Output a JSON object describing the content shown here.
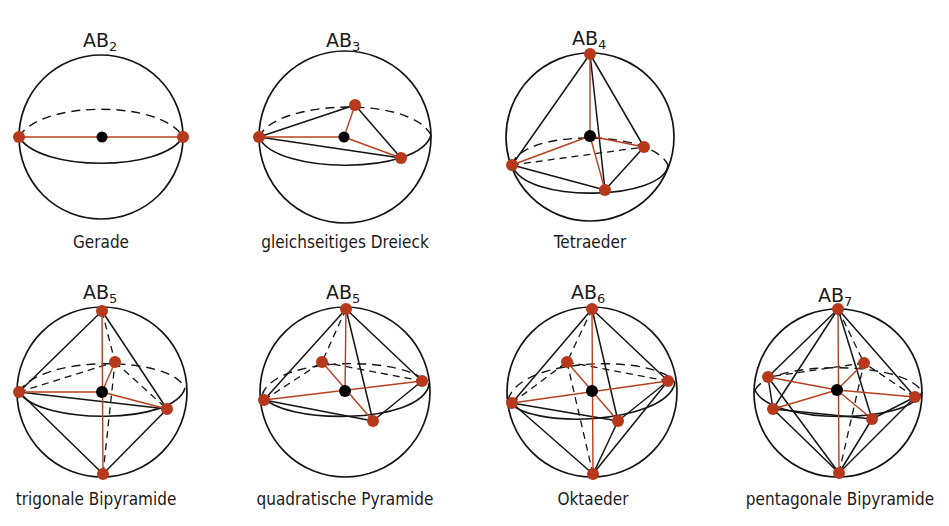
{
  "figure": {
    "colors": {
      "ligand_atom": "#b5391a",
      "bond_line": "#b8401e",
      "central_atom": "#000000",
      "outline": "#141414",
      "background": "#ffffff"
    },
    "panels": [
      {
        "formula_base": "AB",
        "formula_sub": "2",
        "caption": "Gerade"
      },
      {
        "formula_base": "AB",
        "formula_sub": "3",
        "caption": "gleichseitiges Dreieck"
      },
      {
        "formula_base": "AB",
        "formula_sub": "4",
        "caption": "Tetraeder"
      },
      {
        "formula_base": "AB",
        "formula_sub": "5",
        "caption": "trigonale Bipyramide"
      },
      {
        "formula_base": "AB",
        "formula_sub": "5",
        "caption": "quadratische Pyramide"
      },
      {
        "formula_base": "AB",
        "formula_sub": "6",
        "caption": "Oktaeder"
      },
      {
        "formula_base": "AB",
        "formula_sub": "7",
        "caption": "pentagonale Bipyramide"
      }
    ]
  }
}
